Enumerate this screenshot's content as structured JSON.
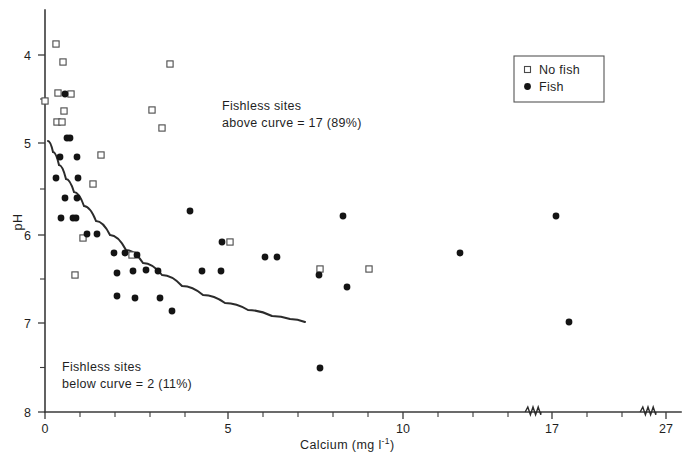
{
  "chart_data": {
    "type": "scatter",
    "title": "",
    "xlabel": "Calcium (mg l",
    "xlabel_sup": "-1",
    "xlabel_tail": ")",
    "ylabel": "pH",
    "xlim": [
      0,
      27
    ],
    "ylim": [
      4,
      8
    ],
    "y_inverted": true,
    "grid": false,
    "x_ticks_major": [
      {
        "value": 0,
        "label": "0",
        "px": 45
      },
      {
        "value": 5,
        "label": "5",
        "px": 228
      },
      {
        "value": 10,
        "label": "10",
        "px": 403
      },
      {
        "value": 17,
        "label": "17",
        "px": 552
      },
      {
        "value": 27,
        "label": "27",
        "px": 666
      }
    ],
    "x_ticks_minor_px": [
      80,
      115,
      150,
      185,
      263,
      298,
      333,
      368,
      438,
      473,
      508,
      587,
      622
    ],
    "axis_breaks_px": [
      533,
      648
    ],
    "y_ticks_major": [
      {
        "value": 4,
        "label": "4",
        "px": 55
      },
      {
        "value": 5,
        "label": "5",
        "px": 143
      },
      {
        "value": 6,
        "label": "6",
        "px": 235
      },
      {
        "value": 7,
        "label": "7",
        "px": 323
      },
      {
        "value": 8,
        "label": "8",
        "px": 412
      }
    ],
    "y_ticks_minor": [
      4.5,
      5.5,
      6.5,
      7.5
    ],
    "legend": {
      "position": "top-right",
      "entries": [
        {
          "label": "No fish",
          "marker": "open-square"
        },
        {
          "label": "Fish",
          "marker": "filled-circle"
        }
      ]
    },
    "annotations": [
      {
        "id": "above",
        "line1": "Fishless sites",
        "line2": "above curve =  17 (89%)"
      },
      {
        "id": "below",
        "line1": "Fishless sites",
        "line2": "below curve =  2 (11%)"
      }
    ],
    "curve": {
      "name": "fitted decay curve",
      "points_px": [
        [
          48,
          141
        ],
        [
          53,
          152
        ],
        [
          59,
          165
        ],
        [
          66,
          179
        ],
        [
          74,
          192
        ],
        [
          84,
          206
        ],
        [
          96,
          221
        ],
        [
          110,
          235
        ],
        [
          126,
          250
        ],
        [
          143,
          263
        ],
        [
          162,
          275
        ],
        [
          182,
          286
        ],
        [
          203,
          295
        ],
        [
          225,
          303
        ],
        [
          248,
          310
        ],
        [
          272,
          316
        ],
        [
          290,
          319
        ],
        [
          305,
          322
        ]
      ]
    },
    "series": [
      {
        "name": "No fish",
        "marker": "open-square",
        "points": [
          {
            "x": 0.3,
            "y": 3.93,
            "px": [
              56,
              44
            ]
          },
          {
            "x": 0.48,
            "y": 4.14,
            "px": [
              63,
              62
            ]
          },
          {
            "x": 0.37,
            "y": 4.49,
            "px": [
              58,
              93
            ]
          },
          {
            "x": 0.75,
            "y": 4.5,
            "px": [
              71,
              94
            ]
          },
          {
            "x": 0.02,
            "y": 4.58,
            "px": [
              45,
              101
            ]
          },
          {
            "x": 0.52,
            "y": 4.69,
            "px": [
              64,
              111
            ]
          },
          {
            "x": 0.33,
            "y": 4.82,
            "px": [
              57,
              122
            ]
          },
          {
            "x": 0.45,
            "y": 4.82,
            "px": [
              62,
              122
            ]
          },
          {
            "x": 1.6,
            "y": 5.19,
            "px": [
              101,
              155
            ]
          },
          {
            "x": 1.35,
            "y": 5.52,
            "px": [
              93,
              184
            ]
          },
          {
            "x": 1.08,
            "y": 6.13,
            "px": [
              83,
              238
            ]
          },
          {
            "x": 2.48,
            "y": 6.33,
            "px": [
              132,
              255
            ]
          },
          {
            "x": 5.28,
            "y": 6.18,
            "px": [
              230,
              242
            ]
          },
          {
            "x": 7.85,
            "y": 6.48,
            "px": [
              320,
              269
            ]
          },
          {
            "x": 9.25,
            "y": 6.48,
            "px": [
              369,
              269
            ]
          },
          {
            "x": 3.58,
            "y": 4.05,
            "px": [
              170,
              64
            ]
          },
          {
            "x": 3.05,
            "y": 4.68,
            "px": [
              152,
              110
            ]
          },
          {
            "x": 3.35,
            "y": 4.88,
            "px": [
              162,
              128
            ]
          },
          {
            "x": 0.85,
            "y": 6.55,
            "px": [
              75,
              275
            ]
          }
        ]
      },
      {
        "name": "Fish",
        "marker": "filled-circle",
        "points": [
          {
            "x": 0.55,
            "y": 4.5,
            "px": [
              65,
              94
            ]
          },
          {
            "x": 0.6,
            "y": 5.0,
            "px": [
              67,
              138
            ]
          },
          {
            "x": 0.72,
            "y": 5.0,
            "px": [
              70,
              138
            ]
          },
          {
            "x": 0.42,
            "y": 5.21,
            "px": [
              60,
              157
            ]
          },
          {
            "x": 0.92,
            "y": 5.21,
            "px": [
              77,
              157
            ]
          },
          {
            "x": 0.3,
            "y": 5.45,
            "px": [
              56,
              178
            ]
          },
          {
            "x": 0.95,
            "y": 5.45,
            "px": [
              78,
              178
            ]
          },
          {
            "x": 0.55,
            "y": 5.68,
            "px": [
              65,
              198
            ]
          },
          {
            "x": 0.9,
            "y": 5.68,
            "px": [
              77,
              198
            ]
          },
          {
            "x": 0.45,
            "y": 5.9,
            "px": [
              61,
              218
            ]
          },
          {
            "x": 0.8,
            "y": 5.9,
            "px": [
              73,
              218
            ]
          },
          {
            "x": 0.88,
            "y": 5.9,
            "px": [
              76,
              218
            ]
          },
          {
            "x": 1.2,
            "y": 6.08,
            "px": [
              87,
              234
            ]
          },
          {
            "x": 1.48,
            "y": 6.08,
            "px": [
              97,
              234
            ]
          },
          {
            "x": 1.98,
            "y": 6.3,
            "px": [
              114,
              253
            ]
          },
          {
            "x": 2.28,
            "y": 6.3,
            "px": [
              125,
              253
            ]
          },
          {
            "x": 2.62,
            "y": 6.33,
            "px": [
              137,
              255
            ]
          },
          {
            "x": 2.05,
            "y": 6.53,
            "px": [
              117,
              273
            ]
          },
          {
            "x": 2.52,
            "y": 6.5,
            "px": [
              133,
              271
            ]
          },
          {
            "x": 2.88,
            "y": 6.49,
            "px": [
              146,
              270
            ]
          },
          {
            "x": 3.22,
            "y": 6.5,
            "px": [
              158,
              271
            ]
          },
          {
            "x": 2.05,
            "y": 6.78,
            "px": [
              117,
              296
            ]
          },
          {
            "x": 2.58,
            "y": 6.8,
            "px": [
              135,
              298
            ]
          },
          {
            "x": 3.28,
            "y": 6.8,
            "px": [
              160,
              298
            ]
          },
          {
            "x": 3.62,
            "y": 6.95,
            "px": [
              172,
              311
            ]
          },
          {
            "x": 4.15,
            "y": 5.82,
            "px": [
              190,
              211
            ]
          },
          {
            "x": 4.48,
            "y": 6.5,
            "px": [
              202,
              271
            ]
          },
          {
            "x": 5.02,
            "y": 6.5,
            "px": [
              221,
              271
            ]
          },
          {
            "x": 5.05,
            "y": 6.18,
            "px": [
              222,
              242
            ]
          },
          {
            "x": 6.28,
            "y": 6.35,
            "px": [
              265,
              257
            ]
          },
          {
            "x": 6.62,
            "y": 6.35,
            "px": [
              277,
              257
            ]
          },
          {
            "x": 7.82,
            "y": 6.55,
            "px": [
              319,
              275
            ]
          },
          {
            "x": 7.85,
            "y": 7.48,
            "px": [
              320,
              368
            ]
          },
          {
            "x": 8.52,
            "y": 5.88,
            "px": [
              343,
              216
            ]
          },
          {
            "x": 8.62,
            "y": 6.68,
            "px": [
              347,
              287
            ]
          },
          {
            "x": 11.85,
            "y": 6.3,
            "px": [
              460,
              253
            ]
          },
          {
            "x": 14.95,
            "y": 7.08,
            "px": [
              569,
              322
            ]
          },
          {
            "x": 17.15,
            "y": 5.88,
            "px": [
              556,
              216
            ]
          }
        ]
      }
    ]
  },
  "legend": {
    "entry_no_fish": "No fish",
    "entry_fish": "Fish"
  },
  "annotations": {
    "above_line1": "Fishless sites",
    "above_line2": "above curve =  17 (89%)",
    "below_line1": "Fishless sites",
    "below_line2": "below curve =  2 (11%)"
  },
  "axes": {
    "y_title": "pH",
    "x_title_main": "Calcium (mg l",
    "x_title_sup": "-1",
    "x_title_tail": ")"
  },
  "colors": {
    "fish_marker": "#141414",
    "nofish_marker_stroke": "#4a4a4a",
    "axis": "#3a3a3a",
    "curve": "#2b2b2b",
    "background": "#ffffff"
  }
}
